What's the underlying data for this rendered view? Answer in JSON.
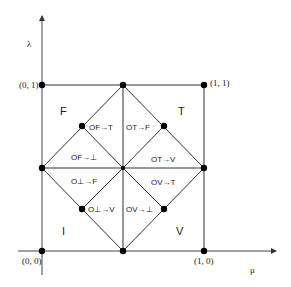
{
  "axes": {
    "y_label": "λ",
    "x_label": "μ"
  },
  "corners": {
    "top_left": "(0, 1)",
    "top_right": "(1, 1)",
    "bottom_left": "(0, 0)",
    "bottom_right": "(1, 0)"
  },
  "regions": {
    "top_left": "F",
    "top_right": "T",
    "bottom_left": "I",
    "bottom_right": "V"
  },
  "orderings": {
    "of_to_t": "OF→T",
    "ot_to_f": "OT→F",
    "of_to_bot": "OF→⊥",
    "ot_to_v": "OT→V",
    "obot_to_f": "O⊥→F",
    "ov_to_t": "OV→T",
    "obot_to_v": "O⊥→V",
    "ov_to_bot": "OV→⊥"
  },
  "colors": {
    "line": "#333333",
    "dot": "#000000",
    "background": "#ffffff"
  }
}
